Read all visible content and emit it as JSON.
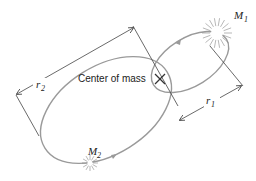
{
  "diagram": {
    "labels": {
      "center_of_mass": "Center of mass",
      "m1_main": "M",
      "m1_sub": "1",
      "m2_main": "M",
      "m2_sub": "2",
      "r1_main": "r",
      "r1_sub": "1",
      "r2_main": "r",
      "r2_sub": "2"
    },
    "elements": {
      "mass_1": {
        "name": "M1",
        "position": [
          217,
          33
        ],
        "description": "larger star, small orbit"
      },
      "mass_2": {
        "name": "M2",
        "position": [
          90,
          163
        ],
        "description": "smaller star, large orbit"
      },
      "center_of_mass": {
        "symbol": "×",
        "position": [
          160,
          79
        ]
      },
      "orbit_1": {
        "type": "ellipse",
        "around": "center_of_mass",
        "size": "small"
      },
      "orbit_2": {
        "type": "ellipse",
        "around": "center_of_mass",
        "size": "large"
      },
      "dimension_r1": {
        "from": "center_of_mass",
        "to": "mass_1"
      },
      "dimension_r2": {
        "from": "center_of_mass",
        "to": "mass_2"
      }
    },
    "colors": {
      "orbit": "#9a9a9a",
      "line": "#444444",
      "text": "#222222",
      "background": "#ffffff"
    }
  }
}
